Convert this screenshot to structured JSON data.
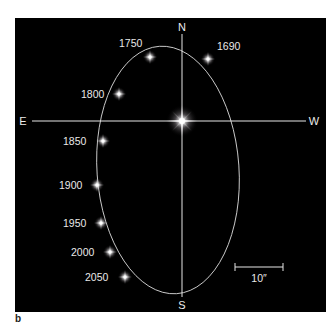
{
  "figure": {
    "panel_label": "b",
    "background_color": "#000000",
    "line_color": "#e6e6e6",
    "directions": {
      "north": "N",
      "south": "S",
      "east": "E",
      "west": "W"
    },
    "scale_bar": {
      "label": "10″"
    },
    "central_star": {
      "name": "central-star",
      "x": 182,
      "y": 121
    },
    "orbit_points": [
      {
        "year": "1690",
        "x": 208,
        "y": 59
      },
      {
        "year": "1750",
        "x": 150,
        "y": 57
      },
      {
        "year": "1800",
        "x": 119,
        "y": 94
      },
      {
        "year": "1850",
        "x": 103,
        "y": 141
      },
      {
        "year": "1900",
        "x": 97,
        "y": 185
      },
      {
        "year": "1950",
        "x": 101,
        "y": 223
      },
      {
        "year": "2000",
        "x": 110,
        "y": 252
      },
      {
        "year": "2050",
        "x": 125,
        "y": 277
      }
    ]
  }
}
